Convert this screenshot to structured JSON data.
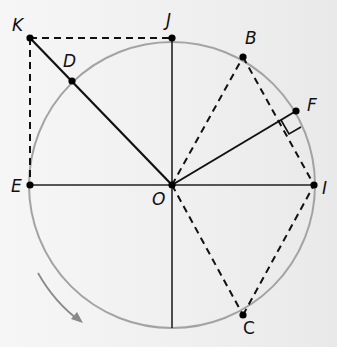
{
  "diagram": {
    "title": "",
    "circle": {
      "center": "O",
      "cx": 172,
      "cy": 185,
      "r": 143,
      "stroke": "#9a9a9a"
    },
    "points": {
      "O": {
        "label": "O",
        "x": 172,
        "y": 185
      },
      "J": {
        "label": "J",
        "x": 172,
        "y": 38
      },
      "K": {
        "label": "K",
        "x": 30,
        "y": 38
      },
      "D": {
        "label": "D",
        "x": 72,
        "y": 81
      },
      "E": {
        "label": "E",
        "x": 30,
        "y": 185
      },
      "B": {
        "label": "B",
        "x": 243,
        "y": 57
      },
      "F": {
        "label": "F",
        "x": 296,
        "y": 111
      },
      "I": {
        "label": "I",
        "x": 314,
        "y": 185
      },
      "C": {
        "label": "C",
        "x": 243,
        "y": 315
      }
    },
    "solid_segments": [
      "OK",
      "OJ",
      "OE",
      "OI",
      "OF",
      "O-bottom"
    ],
    "dashed_segments": [
      "KJ",
      "KE",
      "OB",
      "BI",
      "OC",
      "CI"
    ],
    "right_angle_mark": "at intersection of OF and BI",
    "rotation_arrow": {
      "direction": "counterclockwise-down",
      "color": "#8a8a8a"
    }
  }
}
